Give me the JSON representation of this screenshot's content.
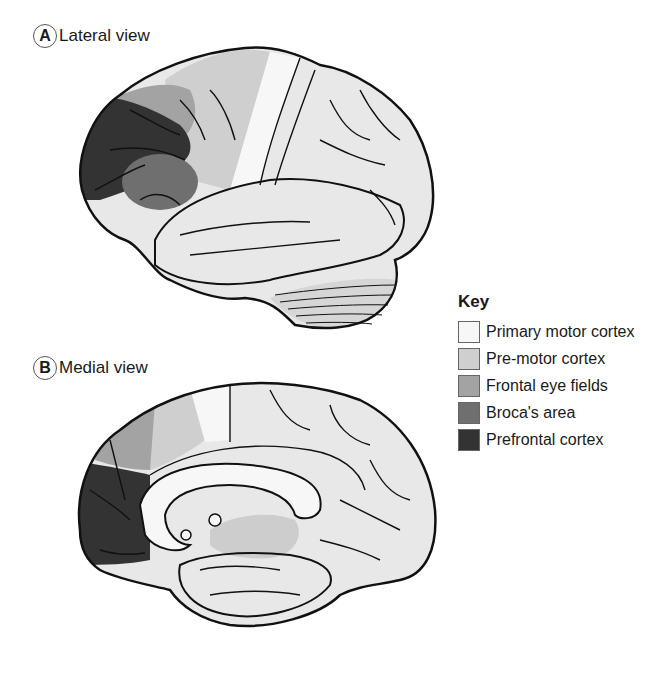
{
  "panels": [
    {
      "letter": "A",
      "title": "Lateral view"
    },
    {
      "letter": "B",
      "title": "Medial view"
    }
  ],
  "legend": {
    "title": "Key",
    "items": [
      {
        "label": "Primary motor cortex",
        "color": "#f7f7f7"
      },
      {
        "label": "Pre-motor cortex",
        "color": "#cfcfcf"
      },
      {
        "label": "Frontal eye fields",
        "color": "#a3a3a3"
      },
      {
        "label": "Broca's area",
        "color": "#6f6f6f"
      },
      {
        "label": "Prefrontal cortex",
        "color": "#333333"
      }
    ]
  },
  "colors": {
    "brain_base": "#e8e8e8",
    "outline": "#111111",
    "cerebellum": "#d6d6d6",
    "thalamus": "#cdcdcd"
  }
}
